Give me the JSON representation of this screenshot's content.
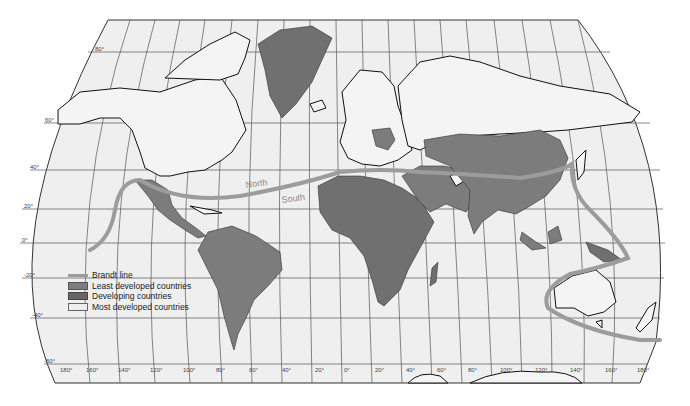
{
  "map": {
    "title": "Brandt line world development map",
    "labels": {
      "north": "North",
      "south": "South"
    },
    "latitude_ticks": [
      {
        "label": "80°",
        "y": 52,
        "x": 95
      },
      {
        "label": "60°",
        "y": 123,
        "x": 45
      },
      {
        "label": "40°",
        "y": 170,
        "x": 30
      },
      {
        "label": "20°",
        "y": 209,
        "x": 24
      },
      {
        "label": "0°",
        "y": 243,
        "x": 22
      },
      {
        "label": "-20°",
        "y": 278,
        "x": 24
      },
      {
        "label": "-40°",
        "y": 318,
        "x": 32
      },
      {
        "label": "-60°",
        "y": 364,
        "x": 44
      }
    ],
    "longitude_ticks": [
      "180°",
      "160°",
      "140°",
      "120°",
      "100°",
      "80°",
      "60°",
      "40°",
      "20°",
      "0°",
      "20°",
      "40°",
      "60°",
      "80°",
      "100°",
      "120°",
      "140°",
      "160°",
      "180°"
    ],
    "colors": {
      "background": "#efefef",
      "most_developed": "#f4f4f4",
      "least_developed": "#707070",
      "developing": "#7c7c7c",
      "brandt_line": "#9c9c9c"
    }
  },
  "legend": {
    "items": [
      {
        "label": "Brandt line",
        "type": "line",
        "color": "#9c9c9c"
      },
      {
        "label": "Least developed countries",
        "type": "swatch",
        "color": "#7d7d7d"
      },
      {
        "label": "Developing countries",
        "type": "swatch",
        "color": "#666666"
      },
      {
        "label": "Most developed countries",
        "type": "swatch",
        "color": "#eeeeee"
      }
    ]
  }
}
